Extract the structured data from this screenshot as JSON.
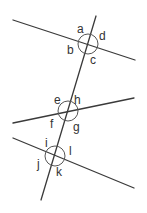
{
  "diagram": {
    "line_color": "#3a3a3a",
    "transversal": {
      "x1": 96,
      "y1": 16,
      "x2": 41,
      "y2": 200
    },
    "lines": [
      {
        "id": "line-1",
        "x1": 13,
        "y1": 20,
        "x2": 135,
        "y2": 60
      },
      {
        "id": "line-2",
        "x1": 13,
        "y1": 123,
        "x2": 134,
        "y2": 98
      },
      {
        "id": "line-3",
        "x1": 13,
        "y1": 138,
        "x2": 134,
        "y2": 188
      }
    ],
    "intersections": [
      {
        "id": "intersection-1",
        "cx": 88,
        "cy": 44,
        "r": 10,
        "labels": [
          {
            "text": "a",
            "x": 77,
            "y": 33
          },
          {
            "text": "d",
            "x": 99,
            "y": 40
          },
          {
            "text": "b",
            "x": 67,
            "y": 54
          },
          {
            "text": "c",
            "x": 90,
            "y": 64
          }
        ]
      },
      {
        "id": "intersection-2",
        "cx": 68,
        "cy": 111,
        "r": 10,
        "labels": [
          {
            "text": "e",
            "x": 54,
            "y": 104
          },
          {
            "text": "h",
            "x": 74,
            "y": 104
          },
          {
            "text": "f",
            "x": 50,
            "y": 128
          },
          {
            "text": "g",
            "x": 73,
            "y": 131
          }
        ]
      },
      {
        "id": "intersection-3",
        "cx": 55,
        "cy": 156,
        "r": 10,
        "labels": [
          {
            "text": "i",
            "x": 45,
            "y": 147
          },
          {
            "text": "l",
            "x": 69,
            "y": 155
          },
          {
            "text": "j",
            "x": 37,
            "y": 168
          },
          {
            "text": "k",
            "x": 56,
            "y": 176
          }
        ]
      }
    ]
  }
}
